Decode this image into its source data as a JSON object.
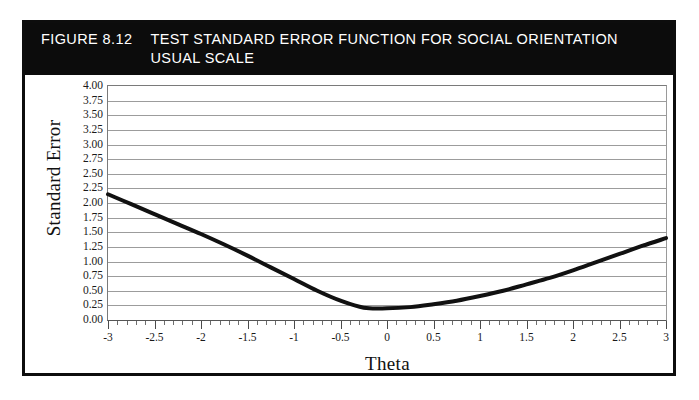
{
  "figure": {
    "number_label": "FIGURE 8.12",
    "title_line1": "TEST STANDARD ERROR FUNCTION FOR SOCIAL ORIENTATION",
    "title_line2": "USUAL SCALE",
    "title_bar_color": "#0c0c0c",
    "title_text_color": "#ffffff",
    "border_color": "#0d0d0d",
    "background_color": "#ffffff"
  },
  "chart_data": {
    "type": "line",
    "title": "TEST STANDARD ERROR FUNCTION FOR SOCIAL ORIENTATION USUAL SCALE",
    "xlabel": "Theta",
    "ylabel": "Standard Error",
    "xlim": [
      -3,
      3
    ],
    "ylim": [
      0.0,
      4.0
    ],
    "grid": true,
    "legend": "none",
    "curve_color": "#111111",
    "curve_width_px": 4,
    "gridline_color": "#9c9c9c",
    "xticks": [
      -3,
      -2.5,
      -2,
      -1.5,
      -1,
      -0.5,
      0,
      0.5,
      1,
      1.5,
      2,
      2.5,
      3
    ],
    "xtick_labels": [
      "-3",
      "-2.5",
      "-2",
      "-1.5",
      "-1",
      "-0.5",
      "0",
      "0.5",
      "1",
      "1.5",
      "2",
      "2.5",
      "3"
    ],
    "xtick_minor_step": 0.1,
    "yticks": [
      4.0,
      3.75,
      3.5,
      3.25,
      3.0,
      2.75,
      2.5,
      2.25,
      2.0,
      1.75,
      1.5,
      1.25,
      1.0,
      0.75,
      0.5,
      0.25,
      0.0
    ],
    "ytick_labels": [
      "4.00",
      "3.75",
      "3.50",
      "3.25",
      "3.00",
      "2.75",
      "2.50",
      "2.25",
      "2.00",
      "1.75",
      "1.50",
      "1.25",
      "1.00",
      "0.75",
      "0.50",
      "0.25",
      "0.00"
    ],
    "series": [
      {
        "name": "Standard Error",
        "x": [
          -3.0,
          -2.75,
          -2.5,
          -2.25,
          -2.0,
          -1.75,
          -1.5,
          -1.25,
          -1.0,
          -0.75,
          -0.5,
          -0.25,
          0.0,
          0.25,
          0.5,
          0.75,
          1.0,
          1.25,
          1.5,
          1.75,
          2.0,
          2.25,
          2.5,
          2.75,
          3.0
        ],
        "values": [
          2.15,
          1.98,
          1.81,
          1.64,
          1.47,
          1.29,
          1.1,
          0.9,
          0.7,
          0.5,
          0.33,
          0.21,
          0.2,
          0.22,
          0.27,
          0.33,
          0.41,
          0.5,
          0.61,
          0.72,
          0.85,
          0.99,
          1.13,
          1.27,
          1.4
        ]
      }
    ],
    "annotations": {
      "minimum_theta": -0.2,
      "minimum_value": 0.2,
      "left_endpoint": 2.15,
      "right_endpoint": 1.4
    }
  }
}
